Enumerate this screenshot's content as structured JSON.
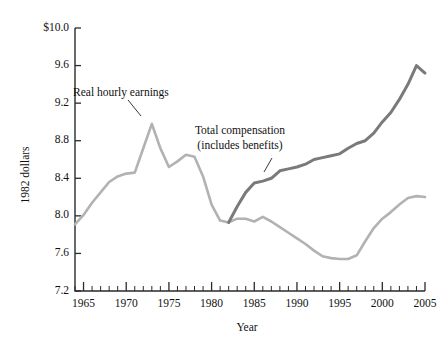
{
  "chart_data": {
    "type": "line",
    "title": "",
    "xlabel": "Year",
    "ylabel": "1982 dollars",
    "xlim": [
      1964,
      2005
    ],
    "ylim": [
      7.2,
      10.0
    ],
    "grid": false,
    "legend_position": "inline-annotations",
    "x_major_ticks": [
      1965,
      1970,
      1975,
      1980,
      1985,
      1990,
      1995,
      2000,
      2005
    ],
    "x_major_tick_labels": [
      "1965",
      "1970",
      "1975",
      "1980",
      "1985",
      "1990",
      "1995",
      "2000",
      "2005"
    ],
    "x_minor_tick_step": 1,
    "y_ticks": [
      7.2,
      7.6,
      8.0,
      8.4,
      8.8,
      9.2,
      9.6,
      10.0
    ],
    "y_tick_labels": [
      "7.2",
      "7.6",
      "8.0",
      "8.4",
      "8.8",
      "9.2",
      "9.6",
      "$10.0"
    ],
    "series": [
      {
        "name": "Real hourly earnings",
        "color": "#b2b2b2",
        "width": 2.6,
        "x": [
          1964,
          1965,
          1966,
          1967,
          1968,
          1969,
          1970,
          1971,
          1972,
          1973,
          1974,
          1975,
          1976,
          1977,
          1978,
          1979,
          1980,
          1981,
          1982,
          1983,
          1984,
          1985,
          1986,
          1987,
          1988,
          1989,
          1990,
          1991,
          1992,
          1993,
          1994,
          1995,
          1996,
          1997,
          1998,
          1999,
          2000,
          2001,
          2002,
          2003,
          2004,
          2005
        ],
        "values": [
          7.91,
          8.01,
          8.14,
          8.25,
          8.36,
          8.42,
          8.45,
          8.46,
          8.72,
          8.98,
          8.72,
          8.52,
          8.58,
          8.65,
          8.63,
          8.42,
          8.12,
          7.95,
          7.93,
          7.97,
          7.97,
          7.94,
          7.99,
          7.94,
          7.88,
          7.82,
          7.76,
          7.7,
          7.63,
          7.57,
          7.55,
          7.54,
          7.54,
          7.58,
          7.73,
          7.87,
          7.97,
          8.04,
          8.12,
          8.19,
          8.21,
          8.2
        ]
      },
      {
        "name": "Total compensation (includes benefits)",
        "color": "#7a7a7a",
        "width": 3.0,
        "x": [
          1982,
          1983,
          1984,
          1985,
          1986,
          1987,
          1988,
          1989,
          1990,
          1991,
          1992,
          1993,
          1994,
          1995,
          1996,
          1997,
          1998,
          1999,
          2000,
          2001,
          2002,
          2003,
          2004,
          2005
        ],
        "values": [
          7.93,
          8.1,
          8.25,
          8.35,
          8.37,
          8.4,
          8.48,
          8.5,
          8.52,
          8.55,
          8.6,
          8.62,
          8.64,
          8.66,
          8.72,
          8.77,
          8.8,
          8.88,
          9.0,
          9.1,
          9.24,
          9.4,
          9.6,
          9.52
        ]
      }
    ],
    "annotations": [
      {
        "text": "Real hourly earnings",
        "x_px": 73,
        "y_px": 96,
        "leader_from": [
          128,
          100
        ],
        "leader_to": [
          141,
          116
        ]
      },
      {
        "text_line1": "Total compensation",
        "text_line2": "(includes benefits)",
        "x_px": 240,
        "y_px": 134,
        "leader_from": [
          272,
          158
        ],
        "leader_to": [
          264,
          172
        ]
      }
    ]
  }
}
